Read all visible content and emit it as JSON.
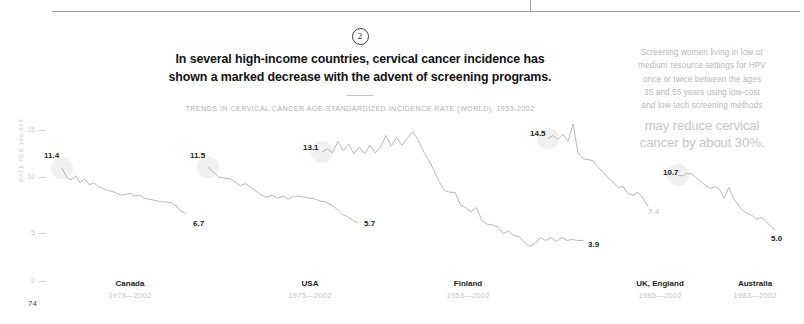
{
  "page_number": "74",
  "header": {
    "badge": "2",
    "headline_line1": "In several high-income countries, cervical cancer incidence has",
    "headline_line2": "shown a marked decrease with the advent of screening programs.",
    "caption": "TRENDS IN CERVICAL CANCER AGE-STANDARDIZED INCIDENCE RATE (WORLD), 1953-2002"
  },
  "sidebar": {
    "paragraph_line1": "Screening women living in low or",
    "paragraph_line2": "medium resource settings for HPV",
    "paragraph_line3": "once or twice between the ages",
    "paragraph_line4": "35 and 55 years using low-cost",
    "paragraph_line5": "and low-tech screening methods",
    "statement_line1": "may reduce cervical",
    "statement_line2": "cancer by about 30%."
  },
  "chart_data": {
    "type": "line",
    "title": "In several high-income countries, cervical cancer incidence has shown a marked decrease with the advent of screening programs.",
    "subtitle": "TRENDS IN CERVICAL CANCER AGE-STANDARDIZED INCIDENCE RATE (WORLD), 1953-2002",
    "xlabel": "",
    "ylabel": "RATE PER 100,000",
    "ylim": [
      0,
      16
    ],
    "yticks": [
      "0",
      "5",
      "10",
      "15"
    ],
    "grid": false,
    "legend": "none",
    "line_color": "#b0b0b0",
    "label_color": "#1c1c1c",
    "series": [
      {
        "name": "Canada",
        "years": "1978—2002",
        "start_label": "11.4",
        "end_label": "6.7",
        "start_value": 11.4,
        "end_value": 6.7,
        "values": [
          11.4,
          10.5,
          10.2,
          10.6,
          9.9,
          10.3,
          9.7,
          9.9,
          9.5,
          9.3,
          9.1,
          9.0,
          8.8,
          8.6,
          8.7,
          8.8,
          8.5,
          8.6,
          8.3,
          8.2,
          8.1,
          8.0,
          7.9,
          7.9,
          7.8,
          7.5,
          7.0,
          6.7
        ]
      },
      {
        "name": "USA",
        "years": "1975—2002",
        "start_label": "11.5",
        "end_label": "5.7",
        "start_value": 11.5,
        "end_value": 5.7,
        "values": [
          11.5,
          11.0,
          10.5,
          10.4,
          10.3,
          10.0,
          9.6,
          9.8,
          9.4,
          9.0,
          8.6,
          8.4,
          8.6,
          8.3,
          8.5,
          8.2,
          8.5,
          8.5,
          8.4,
          8.3,
          8.2,
          8.0,
          7.9,
          7.6,
          7.2,
          6.6,
          6.4,
          6.0,
          5.7
        ]
      },
      {
        "name": "Finland",
        "years": "1953—2002",
        "start_label": "13.1",
        "end_label": "3.9",
        "start_value": 13.1,
        "end_value": 3.9,
        "values": [
          13.1,
          13.4,
          13.0,
          14.2,
          13.2,
          13.9,
          12.9,
          13.6,
          12.9,
          13.8,
          13.0,
          13.6,
          14.8,
          13.7,
          14.6,
          13.8,
          14.5,
          15.2,
          14.4,
          13.2,
          12.3,
          11.2,
          10.0,
          9.1,
          8.9,
          8.9,
          7.6,
          7.3,
          6.9,
          7.3,
          6.0,
          5.6,
          5.5,
          5.3,
          4.6,
          4.9,
          4.4,
          4.3,
          3.7,
          3.3,
          3.6,
          4.2,
          3.9,
          4.2,
          3.8,
          4.2,
          3.9,
          4.0,
          3.9,
          3.9
        ]
      },
      {
        "name": "UK, England",
        "years": "1985—2002",
        "start_label": "14.5",
        "end_label": "7.4",
        "start_value": 14.5,
        "end_value": 7.4,
        "values": [
          14.5,
          14.8,
          14.4,
          14.9,
          14.2,
          16.0,
          13.0,
          12.4,
          12.3,
          12.2,
          11.5,
          11.0,
          10.4,
          10.0,
          9.4,
          9.5,
          8.8,
          8.6,
          8.9,
          8.3,
          7.4
        ]
      },
      {
        "name": "Australia",
        "years": "1983—2002",
        "start_label": "10.7",
        "end_label": "5.0",
        "start_value": 10.7,
        "end_value": 5.0,
        "values": [
          10.7,
          10.6,
          10.9,
          10.8,
          10.4,
          10.0,
          9.6,
          9.3,
          9.5,
          9.2,
          8.3,
          9.4,
          8.3,
          7.6,
          7.0,
          6.7,
          6.5,
          6.1,
          6.3,
          5.9,
          5.4,
          5.0
        ]
      }
    ]
  }
}
